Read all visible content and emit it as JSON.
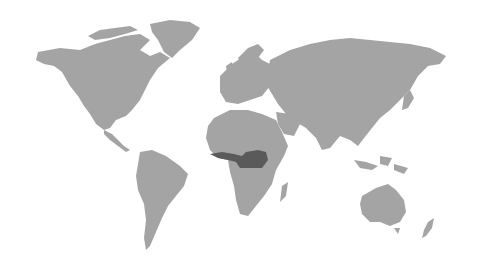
{
  "map": {
    "type": "world-map",
    "projection": "miller",
    "land_color": "#a4a4a4",
    "highlight_color": "#5a5a5a",
    "background_color": "#ffffff",
    "highlighted_regions": [
      {
        "name": "West and Central Africa tropical belt",
        "approx_extent": "Guinea coast to Central African Republic / DR Congo"
      }
    ],
    "continents": [
      "North America",
      "Greenland",
      "South America",
      "Europe",
      "Africa",
      "Asia",
      "Australia",
      "New Zealand"
    ]
  }
}
